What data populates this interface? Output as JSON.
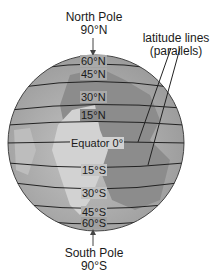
{
  "north_pole": {
    "name": "North Pole",
    "degree": "90°N"
  },
  "south_pole": {
    "name": "South Pole",
    "degree": "90°S"
  },
  "callout": {
    "line1": "latitude lines",
    "line2": "(parallels)"
  },
  "parallels": [
    {
      "label": "60°N"
    },
    {
      "label": "45°N"
    },
    {
      "label": "30°N"
    },
    {
      "label": "15°N"
    },
    {
      "label": "Equator 0°"
    },
    {
      "label": "15°S"
    },
    {
      "label": "30°S"
    },
    {
      "label": "45°S"
    },
    {
      "label": "60°S"
    }
  ],
  "colors": {
    "ocean": "#a9a9a9",
    "land": "#8c8c8c",
    "highlight": "#d6d6d6",
    "line": "#222222"
  }
}
